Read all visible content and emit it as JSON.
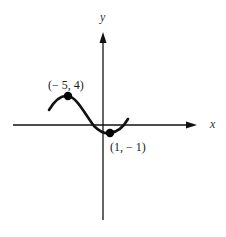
{
  "figure": {
    "type": "function-graph",
    "axes": {
      "x_label": "x",
      "y_label": "y"
    },
    "points": [
      {
        "label": "(− 5, 4)",
        "x": -5,
        "y": 4
      },
      {
        "label": "(1, − 1)",
        "x": 1,
        "y": -1
      }
    ],
    "curve": {
      "description": "smooth curve with local maximum at (-5, 4) and local minimum at (1, -1)",
      "color": "#111111"
    },
    "colors": {
      "axis": "#111111",
      "curve": "#111111",
      "background": "#ffffff"
    }
  }
}
